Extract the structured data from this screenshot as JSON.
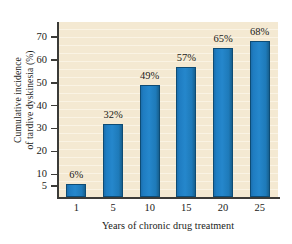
{
  "figure": {
    "background_color": "#ffffff",
    "plot_background_color": "#f4e9d2",
    "bar_color": "#1f7dc2",
    "bar_edge_color": "#0e4c75",
    "axis_color": "#3b3b38",
    "text_color": "#1a1a18"
  },
  "chart_data": {
    "type": "bar",
    "title": "",
    "xlabel": "Years of chronic drug treatment",
    "ylabel_line1": "Cumulative incidence",
    "ylabel_line2": "of tardive dyskinesia (%)",
    "ylabel": "Cumulative incidence of tardive dyskinesia (%)",
    "categories": [
      "1",
      "5",
      "10",
      "15",
      "20",
      "25"
    ],
    "values": [
      6,
      32,
      49,
      57,
      65,
      68
    ],
    "data_labels": [
      "6%",
      "32%",
      "49%",
      "57%",
      "65%",
      "68%"
    ],
    "ylim": [
      0,
      74
    ],
    "yticks": [
      5,
      10,
      20,
      30,
      40,
      50,
      60,
      70
    ],
    "ytick_labels": [
      "5",
      "10",
      "20",
      "30",
      "40",
      "50",
      "60",
      "70"
    ],
    "xtick_labels": [
      "1",
      "5",
      "10",
      "15",
      "20",
      "25"
    ],
    "grid": false,
    "legend": null
  }
}
